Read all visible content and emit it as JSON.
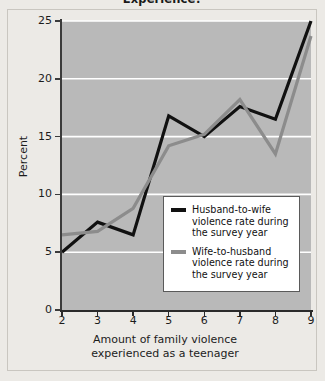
{
  "title": "Experience?",
  "axes": {
    "ylabel": "Percent",
    "xlabel_line1": "Amount of family violence",
    "xlabel_line2": "experienced as a teenager",
    "yticks": [
      "0",
      "5",
      "10",
      "15",
      "20",
      "25"
    ],
    "xticks": [
      "2",
      "3",
      "4",
      "5",
      "6",
      "7",
      "8",
      "9"
    ]
  },
  "legend": {
    "items": [
      {
        "color": "#111111",
        "line1": "Husband-to-wife",
        "line2": "violence rate during",
        "line3": "the survey year"
      },
      {
        "color": "#8c8c8c",
        "line1": "Wife-to-husband",
        "line2": "violence rate during",
        "line3": "the survey year"
      }
    ]
  },
  "colors": {
    "plot_background": "#b9b9b9",
    "page_background": "#eceae6",
    "gridline": "#ffffff",
    "axis": "#2b2b2b",
    "husband_to_wife": "#111111",
    "wife_to_husband": "#8c8c8c"
  },
  "chart_data": {
    "type": "line",
    "title": "Experience?",
    "xlabel": "Amount of family violence experienced as a teenager",
    "ylabel": "Percent",
    "x": [
      2,
      3,
      4,
      5,
      6,
      7,
      8,
      9
    ],
    "xlim": [
      2,
      9
    ],
    "ylim": [
      0,
      25
    ],
    "yticks": [
      0,
      5,
      10,
      15,
      20,
      25
    ],
    "grid": true,
    "legend_position": "inside-lower-right",
    "series": [
      {
        "name": "Husband-to-wife violence rate during the survey year",
        "color": "#111111",
        "values": [
          5.0,
          7.6,
          6.5,
          16.8,
          15.0,
          17.6,
          16.5,
          25.0
        ]
      },
      {
        "name": "Wife-to-husband violence rate during the survey year",
        "color": "#8c8c8c",
        "values": [
          6.5,
          6.8,
          8.8,
          14.2,
          15.2,
          18.2,
          13.5,
          23.7
        ]
      }
    ]
  }
}
